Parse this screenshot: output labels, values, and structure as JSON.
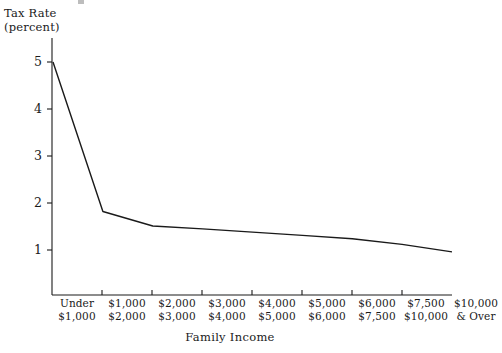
{
  "chart_data": {
    "type": "line",
    "title": "",
    "ylabel": "Tax Rate (percent)",
    "ylabel_line1": "Tax Rate",
    "ylabel_line2": "(percent)",
    "xlabel": "Family Income",
    "ylim": [
      0,
      5.4
    ],
    "yticks": [
      1,
      2,
      3,
      4,
      5
    ],
    "ytick_labels": [
      "1",
      "2",
      "3",
      "4",
      "5"
    ],
    "grid": false,
    "legend": "none",
    "categories": [
      "Under $1,000",
      "$1,000 $2,000",
      "$2,000 $3,000",
      "$3,000 $4,000",
      "$4,000 $5,000",
      "$5,000 $6,000",
      "$6,000 $7,500",
      "$7,500 $10,000",
      "$10,000 & Over"
    ],
    "categories_line1": [
      "Under",
      "$1,000",
      "$2,000",
      "$3,000",
      "$4,000",
      "$5,000",
      "$6,000",
      "$7,500",
      "$10,000"
    ],
    "categories_line2": [
      "$1,000",
      "$2,000",
      "$3,000",
      "$4,000",
      "$5,000",
      "$6,000",
      "$7,500",
      "$10,000",
      "& Over"
    ],
    "values": [
      5.0,
      1.82,
      1.51,
      1.45,
      1.38,
      1.31,
      1.24,
      1.12,
      0.96
    ],
    "series": [
      {
        "name": "Tax Rate",
        "values": [
          5.0,
          1.82,
          1.51,
          1.45,
          1.38,
          1.31,
          1.24,
          1.12,
          0.96
        ]
      }
    ],
    "line_color": "#1a1a1a",
    "axis_color": "#1a1a1a"
  },
  "axes": {
    "x_axis_name": "x-axis",
    "y_axis_name": "y-axis"
  }
}
